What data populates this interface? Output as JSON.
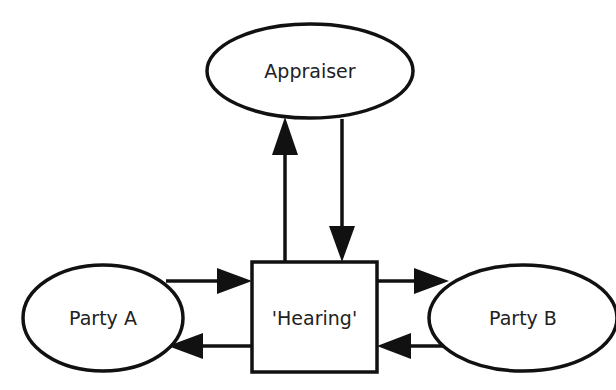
{
  "diagram": {
    "type": "flow",
    "nodes": [
      {
        "id": "appraiser",
        "label": "Appraiser",
        "shape": "ellipse"
      },
      {
        "id": "hearing",
        "label": "'Hearing'",
        "shape": "rectangle"
      },
      {
        "id": "party_a",
        "label": "Party A",
        "shape": "ellipse"
      },
      {
        "id": "party_b",
        "label": "Party B",
        "shape": "ellipse"
      }
    ],
    "edges": [
      {
        "from": "hearing",
        "to": "appraiser"
      },
      {
        "from": "appraiser",
        "to": "hearing"
      },
      {
        "from": "party_a",
        "to": "hearing"
      },
      {
        "from": "hearing",
        "to": "party_a"
      },
      {
        "from": "hearing",
        "to": "party_b"
      },
      {
        "from": "party_b",
        "to": "hearing"
      }
    ]
  },
  "colors": {
    "stroke": "#111111",
    "fill": "#ffffff",
    "text": "#222222"
  }
}
